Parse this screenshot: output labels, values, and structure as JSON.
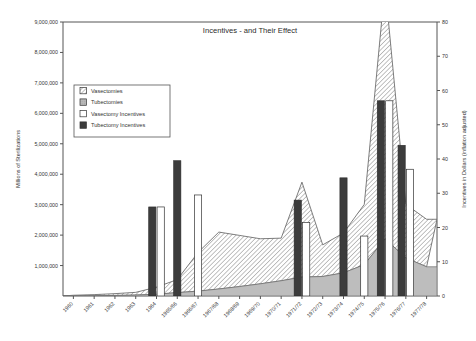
{
  "chart_data": {
    "type": "area",
    "title": "Incentives - and Their Effect",
    "xlabel": "",
    "ylabel": "Millions of Sterilizations",
    "ylabel_right": "Incentives in Dollars (inflation adjusted)",
    "grid": false,
    "legend_position": "upper-left-inside",
    "ylim": [
      0,
      9000000
    ],
    "ylim_right": [
      0,
      80
    ],
    "ytick_labels": [
      "9,000,000",
      "8,000,000",
      "7,000,000",
      "6,000,000",
      "5,000,000",
      "4,000,000",
      "3,000,000",
      "2,000,000",
      "1,000,000"
    ],
    "ytick_values": [
      9000000,
      8000000,
      7000000,
      6000000,
      5000000,
      4000000,
      3000000,
      2000000,
      1000000
    ],
    "ytick_labels_right": [
      "80",
      "70",
      "60",
      "50",
      "40",
      "30",
      "20",
      "10",
      "0"
    ],
    "ytick_values_right": [
      80,
      70,
      60,
      50,
      40,
      30,
      20,
      10,
      0
    ],
    "categories": [
      "1960",
      "1961",
      "1962",
      "1963",
      "1964",
      "1965/66",
      "1966/67",
      "1967/68",
      "1968/69",
      "1969/70",
      "1970/71",
      "1971/72",
      "1972/73",
      "1973/74",
      "1974/75",
      "1975/76",
      "1976/77",
      "1977/78"
    ],
    "series": [
      {
        "name": "Vasectomies",
        "type": "area",
        "stacked_on": "Tubectomies",
        "pattern": "diagonal-hatch",
        "axis": "left",
        "values": [
          20000,
          35000,
          60000,
          90000,
          230000,
          430000,
          1270000,
          1870000,
          1680000,
          1480000,
          1400000,
          3120000,
          1040000,
          1310000,
          1980000,
          8320000,
          1760000,
          1560000
        ]
      },
      {
        "name": "Tubectomies",
        "type": "area",
        "pattern": "solid-gray",
        "axis": "left",
        "values": [
          5000,
          10000,
          18000,
          30000,
          60000,
          110000,
          160000,
          230000,
          310000,
          400000,
          500000,
          620000,
          640000,
          760000,
          1030000,
          1880000,
          1250000,
          960000
        ]
      },
      {
        "name": "Vasectomy Incentives",
        "type": "bar",
        "pattern": "white",
        "axis": "right",
        "values": [
          0,
          0,
          0,
          0,
          26,
          0,
          29.5,
          0,
          0,
          0,
          0,
          21.5,
          0,
          0,
          17.5,
          57,
          37,
          0
        ]
      },
      {
        "name": "Tubectomy Incentives",
        "type": "bar",
        "pattern": "dark",
        "axis": "right",
        "values": [
          0,
          0,
          0,
          0,
          26,
          39.5,
          0,
          0,
          0,
          0,
          0,
          28,
          0,
          34.5,
          0,
          57,
          44,
          0
        ]
      }
    ],
    "legend_entries": [
      {
        "label": "Vasectomies",
        "pattern": "diagonal-hatch"
      },
      {
        "label": "Tubectomies",
        "pattern": "solid-gray"
      },
      {
        "label": "Vasectomy Incentives",
        "pattern": "white"
      },
      {
        "label": "Tubectomy Incentives",
        "pattern": "dark"
      }
    ],
    "colors": {
      "hatch_line": "#6b6b6b",
      "hatch_bg": "#ffffff",
      "gray_fill": "#b8b8b8",
      "dark_fill": "#3a3a3a",
      "white_fill": "#ffffff",
      "axis": "#555555",
      "text": "#333333"
    }
  }
}
